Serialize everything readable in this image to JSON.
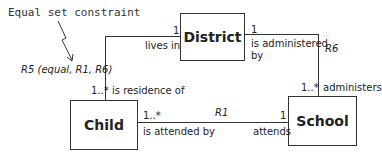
{
  "entities": {
    "district": "District",
    "child": "Child",
    "school": "School"
  },
  "relationships": {
    "r1": {
      "name": "R1",
      "child_mult": "1..*",
      "child_phrase": "is attended by",
      "school_mult": "1",
      "school_phrase": "attends"
    },
    "r5": {
      "name": "R5 (equal, R1, R6)",
      "district_mult": "1",
      "district_phrase": "lives in",
      "child_mult": "1..*",
      "child_phrase": "is residence of"
    },
    "r6": {
      "name": "R6",
      "district_mult": "1",
      "district_phrase_line1": "is administered",
      "district_phrase_line2": "by",
      "school_mult": "1..*",
      "school_phrase": "administers"
    }
  },
  "annotation": {
    "text": "Equal set constraint"
  },
  "colors": {
    "line": "#333333",
    "text": "#222222",
    "background": "#ffffff"
  }
}
